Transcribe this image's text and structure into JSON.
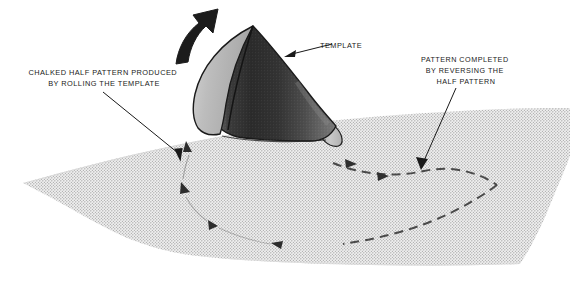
{
  "figure": {
    "background_color": "#ffffff",
    "ink_color": "#1a1a1a"
  },
  "labels": {
    "template": {
      "text": "TEMPLATE",
      "lines": [
        "TEMPLATE"
      ],
      "anchor": "start",
      "x": 320,
      "y": 48
    },
    "left_callout": {
      "lines": [
        "CHALKED HALF PATTERN PRODUCED",
        "BY ROLLING THE TEMPLATE"
      ],
      "anchor": "middle",
      "x": 104,
      "y": 75,
      "line_height": 11
    },
    "right_callout": {
      "lines": [
        "PATTERN COMPLETED",
        "BY REVERSING THE",
        "HALF PATTERN"
      ],
      "anchor": "middle",
      "x": 466,
      "y": 62,
      "line_height": 11
    }
  },
  "objects": {
    "ground_plane": {
      "name": "stippled ground surface",
      "fill": "#e8e8e8",
      "stipple_color": "#9a9a9a",
      "outline": "none"
    },
    "cone_template": {
      "name": "conical sheet-metal template",
      "apex": [
        253,
        26
      ],
      "faces": [
        {
          "name": "inner back face",
          "shade": "#b9b9b9"
        },
        {
          "name": "outer shaded body",
          "shade": "#3a3a3a"
        },
        {
          "name": "base rim",
          "shade": "#c2c2c2"
        }
      ],
      "outline_color": "#1a1a1a"
    },
    "roll_arrow": {
      "name": "rolling direction arrow",
      "fill": "#1a1a1a",
      "direction": "counter-clockwise up and to the right"
    },
    "chalked_half_pattern": {
      "name": "chalked half pattern marks",
      "style": "solid arrow marks",
      "color": "#2a2a2a"
    },
    "reversed_half_pattern": {
      "name": "completed pattern dashed arc",
      "style": "dashed",
      "color": "#4a4a4a"
    }
  },
  "leaders": [
    {
      "name": "template-leader",
      "from": [
        332,
        44
      ],
      "to": [
        286,
        56
      ]
    },
    {
      "name": "left-callout-leader",
      "from": [
        103,
        92
      ],
      "to": [
        184,
        158
      ]
    },
    {
      "name": "right-callout-leader",
      "from": [
        456,
        88
      ],
      "to": [
        421,
        169
      ]
    }
  ]
}
